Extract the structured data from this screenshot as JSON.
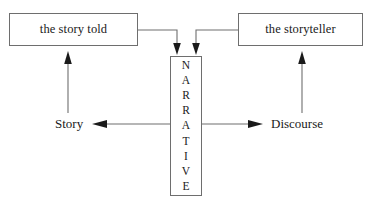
{
  "diagram": {
    "background_color": "#ffffff",
    "stroke_color": "#6e6e6e",
    "arrow_color": "#1a1a1a",
    "text_color": "#1a1a1a",
    "nodes": {
      "story_told": {
        "label": "the story told",
        "shape": "rectangle"
      },
      "storyteller": {
        "label": "the storyteller",
        "shape": "rectangle"
      },
      "narrative": {
        "label": "NARRATIVE",
        "orientation": "vertical",
        "letters": [
          "N",
          "A",
          "R",
          "R",
          "A",
          "T",
          "I",
          "V",
          "E"
        ],
        "shape": "rectangle"
      }
    },
    "labels": {
      "story": "Story",
      "discourse": "Discourse"
    },
    "edges": [
      {
        "name": "story-told-to-narrative",
        "from": "the story told",
        "to": "NARRATIVE",
        "style": "elbow",
        "arrowhead": "down"
      },
      {
        "name": "storyteller-to-narrative",
        "from": "the storyteller",
        "to": "NARRATIVE",
        "style": "elbow",
        "arrowhead": "down"
      },
      {
        "name": "narrative-to-story",
        "from": "NARRATIVE",
        "to": "Story",
        "style": "straight",
        "arrowhead": "left"
      },
      {
        "name": "narrative-to-discourse",
        "from": "NARRATIVE",
        "to": "Discourse",
        "style": "straight",
        "arrowhead": "right"
      },
      {
        "name": "story-to-story-told",
        "from": "Story",
        "to": "the story told",
        "style": "straight",
        "arrowhead": "up"
      },
      {
        "name": "discourse-to-storyteller",
        "from": "Discourse",
        "to": "the storyteller",
        "style": "straight",
        "arrowhead": "up"
      }
    ]
  }
}
